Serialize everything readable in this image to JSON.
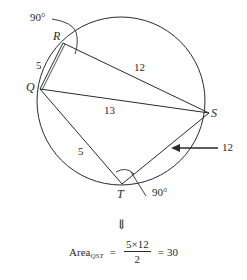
{
  "diagram": {
    "points": {
      "R": "R",
      "Q": "Q",
      "S": "S",
      "T": "T"
    },
    "segments": {
      "QR": "5",
      "RS": "12",
      "QS": "13",
      "QT": "5",
      "TS": "12"
    },
    "angles": {
      "angle_R": "90°",
      "angle_T": "90°"
    },
    "colors": {
      "stroke": "#2a2a2a",
      "background": "#ffffff"
    }
  },
  "arrow_down": "⇓",
  "equation": {
    "lhs": "Area",
    "subscript": "QST",
    "equals1": "=",
    "numerator": "5×12",
    "denominator": "2",
    "equals2": "=",
    "result": "30"
  }
}
